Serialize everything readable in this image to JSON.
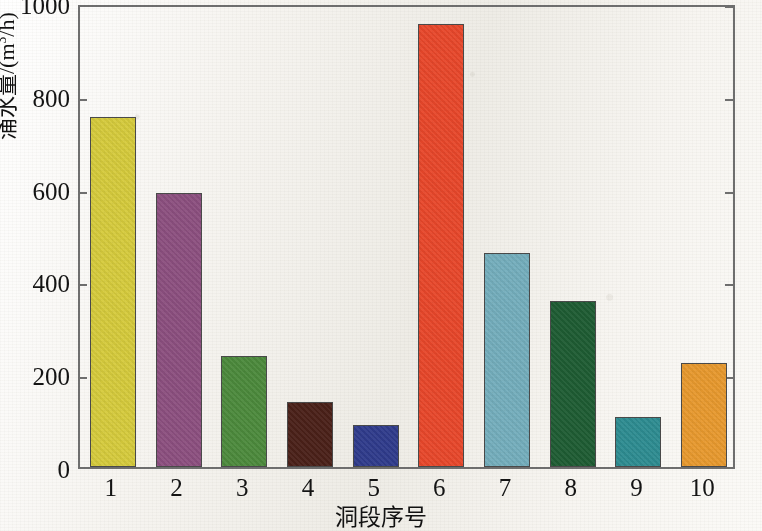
{
  "chart_data": {
    "type": "bar",
    "title": "",
    "xlabel": "洞段序号",
    "ylabel": "涌水量/(m³/h)",
    "categories": [
      "1",
      "2",
      "3",
      "4",
      "5",
      "6",
      "7",
      "8",
      "9",
      "10"
    ],
    "values": [
      755,
      590,
      240,
      140,
      90,
      955,
      462,
      357,
      108,
      225
    ],
    "ylim": [
      0,
      1000
    ],
    "yticks": [
      0,
      200,
      400,
      600,
      800,
      1000
    ],
    "ytick_labels": [
      "0",
      "200",
      "400",
      "600",
      "800",
      "1000"
    ],
    "grid": false,
    "legend": "none",
    "bar_colors": [
      "#d6cb3c",
      "#8c4f7f",
      "#4c8a3c",
      "#4a2018",
      "#2f3b8c",
      "#e8472a",
      "#74aebd",
      "#1e5c33",
      "#2d8c91",
      "#e8992e"
    ],
    "bar_edge_color": "#4a4a4a",
    "axis_color": "#6f6f6f",
    "background_color": "#f4f2ee"
  },
  "axis": {
    "y_title_main": "涌水量/(m",
    "y_title_sup": "3",
    "y_title_tail": "/h)",
    "x_title": "洞段序号"
  }
}
